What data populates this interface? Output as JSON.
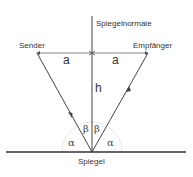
{
  "labels": {
    "normal": "Spiegelnormale",
    "sender": "Sender",
    "receiver": "Empfänger",
    "mirror": "Spiegel",
    "a_left": "a",
    "a_right": "a",
    "h": "h",
    "alpha_left": "α",
    "alpha_right": "α",
    "beta_left": "β",
    "beta_right": "β"
  },
  "colors": {
    "line": "#444444",
    "arc": "#dddddd"
  }
}
